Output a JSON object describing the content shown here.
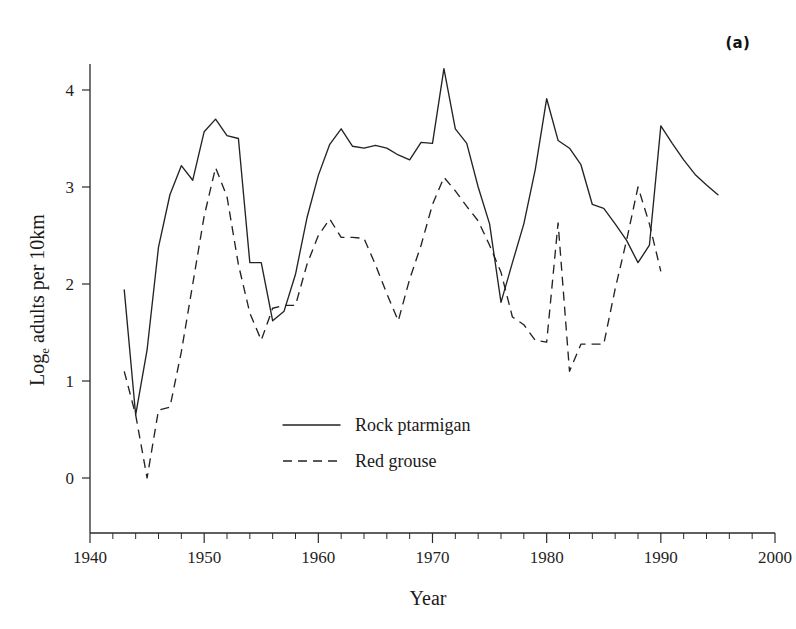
{
  "panel": {
    "label": "(a)"
  },
  "top_artifact": {
    "text": ""
  },
  "legend": {
    "position": "inside-center",
    "entries": [
      {
        "label": "Rock ptarmigan",
        "style": "solid"
      },
      {
        "label": "Red grouse",
        "style": "dashed"
      }
    ]
  },
  "axes": {
    "x": {
      "title": "Year",
      "min": 1940,
      "max": 2000,
      "major_step": 10,
      "minor_step": 2,
      "ticklabels": [
        "1940",
        "1950",
        "1960",
        "1970",
        "1980",
        "1990",
        "2000"
      ]
    },
    "y": {
      "title_parts": {
        "main": "Log",
        "sub": "e",
        "rest": " adults per 10km"
      },
      "title": "Loge adults per 10km",
      "min": -0.35,
      "max": 4.55,
      "major_step": 1,
      "ticklabels": [
        "0",
        "1",
        "2",
        "3",
        "4"
      ],
      "tickvalues": [
        0,
        1,
        2,
        3,
        4
      ]
    }
  },
  "chart_data": {
    "type": "line",
    "title": "",
    "subtitle": "",
    "xlabel": "Year",
    "ylabel": "Loge adults per 10km",
    "xlim": [
      1940,
      2000
    ],
    "ylim": [
      -0.35,
      4.55
    ],
    "grid": false,
    "legend_position": "inside-center",
    "annotations": [
      "(a)"
    ],
    "series": [
      {
        "name": "Rock ptarmigan",
        "style": "solid",
        "x": [
          1943,
          1944,
          1945,
          1946,
          1947,
          1948,
          1949,
          1950,
          1951,
          1952,
          1953,
          1954,
          1955,
          1956,
          1957,
          1958,
          1959,
          1960,
          1961,
          1962,
          1963,
          1964,
          1965,
          1966,
          1967,
          1968,
          1969,
          1970,
          1971,
          1972,
          1973,
          1974,
          1975,
          1976,
          1977,
          1978,
          1979,
          1980,
          1981,
          1982,
          1983,
          1984,
          1985,
          1986,
          1987,
          1988,
          1989,
          1990,
          1991,
          1992,
          1993,
          1994,
          1995
        ],
        "values": [
          1.94,
          0.65,
          1.32,
          2.38,
          2.92,
          3.22,
          3.07,
          3.57,
          3.7,
          3.53,
          3.5,
          2.22,
          2.22,
          1.62,
          1.72,
          2.1,
          2.68,
          3.12,
          3.44,
          3.6,
          3.42,
          3.4,
          3.43,
          3.4,
          3.33,
          3.28,
          3.46,
          3.45,
          4.22,
          3.6,
          3.45,
          3.0,
          2.62,
          1.81,
          2.22,
          2.62,
          3.18,
          3.91,
          3.48,
          3.4,
          3.23,
          2.82,
          2.78,
          2.62,
          2.45,
          2.22,
          2.4,
          3.63,
          3.45,
          3.28,
          3.13,
          3.02,
          2.92
        ]
      },
      {
        "name": "Red grouse",
        "style": "dashed",
        "x": [
          1943,
          1944,
          1945,
          1946,
          1947,
          1948,
          1949,
          1950,
          1951,
          1952,
          1953,
          1954,
          1955,
          1956,
          1957,
          1958,
          1959,
          1960,
          1961,
          1962,
          1963,
          1964,
          1965,
          1966,
          1967,
          1968,
          1969,
          1970,
          1971,
          1972,
          1973,
          1974,
          1975,
          1976,
          1977,
          1978,
          1979,
          1980,
          1981,
          1982,
          1983,
          1984,
          1985,
          1986,
          1987,
          1988,
          1989,
          1990
        ],
        "values": [
          1.1,
          0.65,
          0.0,
          0.7,
          0.73,
          1.3,
          2.0,
          2.7,
          3.2,
          2.9,
          2.2,
          1.7,
          1.42,
          1.75,
          1.78,
          1.78,
          2.2,
          2.5,
          2.67,
          2.48,
          2.48,
          2.47,
          2.2,
          1.9,
          1.62,
          2.05,
          2.4,
          2.82,
          3.1,
          2.96,
          2.8,
          2.65,
          2.4,
          2.12,
          1.66,
          1.58,
          1.42,
          1.4,
          2.63,
          1.1,
          1.38,
          1.38,
          1.38,
          1.95,
          2.45,
          3.0,
          2.62,
          2.13
        ]
      }
    ]
  }
}
